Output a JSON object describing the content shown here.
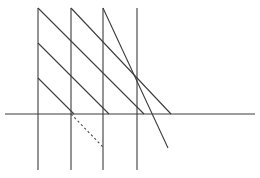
{
  "canvas": {
    "width": 260,
    "height": 178,
    "background_color": "#ffffff",
    "title": "Geometric line diagram"
  },
  "style": {
    "line_color": "#4a4a4a",
    "line_color_dark": "#3c3c3c",
    "stroke_width": 1.1,
    "dash_pattern": "2.2 2.6"
  },
  "chart_data": {
    "type": "diagram",
    "title": "",
    "xlabel": "",
    "ylabel": "",
    "xlim": [
      0,
      260
    ],
    "ylim": [
      0,
      178
    ],
    "grid": false,
    "legend": "none",
    "vertical_lines": [
      {
        "name": "vertical-1",
        "x": 38,
        "y1": 8,
        "y2": 170
      },
      {
        "name": "vertical-2",
        "x": 71,
        "y1": 8,
        "y2": 170
      },
      {
        "name": "vertical-3",
        "x": 103,
        "y1": 8,
        "y2": 170
      },
      {
        "name": "vertical-4",
        "x": 137,
        "y1": 8,
        "y2": 170
      }
    ],
    "horizontal_lines": [
      {
        "name": "axis-horizontal",
        "y": 114,
        "x1": 5,
        "x2": 255
      }
    ],
    "solid_diagonals": [
      {
        "name": "diagonal-1",
        "x1": 38,
        "y1": 8,
        "x2": 144,
        "y2": 114
      },
      {
        "name": "diagonal-2",
        "x1": 38,
        "y1": 43,
        "x2": 109,
        "y2": 114
      },
      {
        "name": "diagonal-3",
        "x1": 38,
        "y1": 78,
        "x2": 74,
        "y2": 114
      },
      {
        "name": "diagonal-4",
        "x1": 71,
        "y1": 8,
        "x2": 171,
        "y2": 114
      },
      {
        "name": "diagonal-5",
        "x1": 103,
        "y1": 8,
        "x2": 168,
        "y2": 148
      }
    ],
    "dashed_diagonals": [
      {
        "name": "dashed-diagonal-1",
        "x1": 71,
        "y1": 114,
        "x2": 103,
        "y2": 147
      }
    ]
  }
}
